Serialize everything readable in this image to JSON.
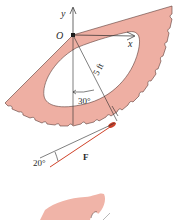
{
  "figure": {
    "type": "statics-diagram",
    "labels": {
      "origin": "O",
      "y_axis": "y",
      "x_axis": "x",
      "radius": "5 ft",
      "angle_from_vertical": "30°",
      "force_angle": "20°",
      "force": "F"
    },
    "colors": {
      "body_fill": "#eeafa3",
      "body_stroke": "#5a3a36",
      "line": "#2a2a2a",
      "force": "#d0432a",
      "background": "#ffffff"
    }
  }
}
